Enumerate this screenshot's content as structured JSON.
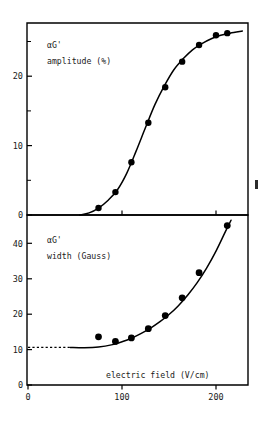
{
  "figure": {
    "background": "#ffffff",
    "ink_color": "#000000"
  },
  "chart_data": [
    {
      "type": "scatter",
      "panel": "top",
      "title": "",
      "annotation_line1": "αG'",
      "annotation_line2": "amplitude (%)",
      "xlabel": "",
      "ylabel": "",
      "xlim": [
        0,
        235
      ],
      "ylim": [
        0,
        27.5
      ],
      "xticks": [
        0,
        100,
        200
      ],
      "xticklabels": [
        "",
        "",
        ""
      ],
      "yticks": [
        0,
        10,
        20
      ],
      "yticklabels": [
        "0",
        "10",
        "20"
      ],
      "yminorticks": [
        5,
        15,
        25
      ],
      "grid": false,
      "legend": null,
      "x": [
        75,
        93,
        110,
        128,
        146,
        164,
        182,
        200,
        212
      ],
      "values": [
        1.0,
        3.3,
        7.6,
        13.3,
        18.4,
        22.1,
        24.5,
        25.9,
        26.2
      ],
      "fit_curve": {
        "description": "sigmoidal fit through points",
        "x": [
          55,
          65,
          75,
          85,
          95,
          105,
          115,
          125,
          135,
          145,
          155,
          165,
          175,
          185,
          195,
          205,
          215,
          228
        ],
        "y": [
          0.0,
          0.3,
          1.0,
          2.1,
          3.6,
          6.0,
          9.2,
          12.6,
          15.9,
          18.6,
          20.9,
          22.5,
          23.8,
          24.7,
          25.4,
          25.9,
          26.2,
          26.5
        ]
      }
    },
    {
      "type": "scatter",
      "panel": "bottom",
      "title": "",
      "annotation_line1": "αG'",
      "annotation_line2": "width (Gauss)",
      "xlabel": "electric field (V/cm)",
      "ylabel": "",
      "xlim": [
        0,
        235
      ],
      "ylim": [
        0,
        48
      ],
      "xticks": [
        0,
        100,
        200
      ],
      "xticklabels": [
        "0",
        "100",
        "200"
      ],
      "yticks": [
        0,
        10,
        20,
        30,
        40
      ],
      "yticklabels": [
        "0",
        "10",
        "20",
        "30",
        "40"
      ],
      "grid": false,
      "legend": null,
      "x": [
        75,
        93,
        110,
        128,
        146,
        164,
        182,
        212
      ],
      "values": [
        13.6,
        12.3,
        13.3,
        15.9,
        19.6,
        24.6,
        31.7,
        45.0
      ],
      "baseline": {
        "description": "dashed horizontal baseline",
        "y": 10.6,
        "x_start": 0,
        "x_end": 45
      },
      "fit_curve": {
        "description": "rising fit through points",
        "x": [
          45,
          60,
          75,
          90,
          100,
          110,
          120,
          130,
          140,
          150,
          160,
          170,
          180,
          190,
          200,
          210,
          216
        ],
        "y": [
          10.6,
          10.5,
          10.7,
          11.4,
          12.2,
          13.2,
          14.5,
          16.0,
          17.8,
          19.9,
          22.4,
          25.4,
          28.9,
          33.0,
          37.8,
          43.3,
          46.5
        ]
      }
    }
  ]
}
